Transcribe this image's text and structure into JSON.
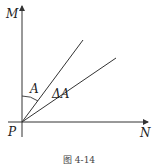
{
  "figure": {
    "caption": "图 4-14",
    "labels": {
      "vertical_axis": "M",
      "horizontal_axis": "N",
      "origin": "P",
      "angle": "A",
      "delta_angle": "ΔA"
    },
    "colors": {
      "line": "#333333",
      "background": "#ffffff"
    }
  }
}
